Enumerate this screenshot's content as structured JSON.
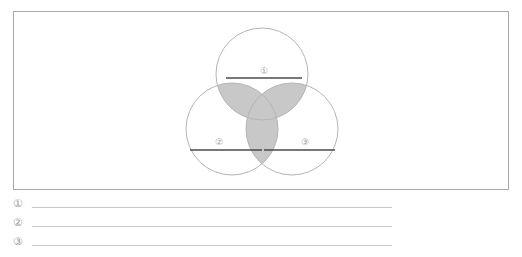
{
  "page": {
    "background_color": "#ffffff",
    "width": 522,
    "height": 257
  },
  "diagram_box": {
    "border_color": "#a8a8a8",
    "fill_color": "#ffffff"
  },
  "venn": {
    "type": "three-set-venn",
    "circle_stroke_color": "#b5b5b5",
    "circle_fill_color": "#ffffff",
    "overlap_fill_color": "#c8c8c8",
    "answer_line_color": "#4a4a4a",
    "label_color": "#9a9a9a",
    "circles": [
      {
        "id": "circle-1",
        "label": "①",
        "position": "top",
        "cx": 262,
        "cy": 74,
        "r": 46,
        "answer_line": {
          "x1": 226,
          "x2": 302,
          "y": 78
        },
        "label_x": 264,
        "label_y": 72
      },
      {
        "id": "circle-2",
        "label": "②",
        "position": "bottom-left",
        "cx": 232,
        "cy": 129,
        "r": 46,
        "answer_line": {
          "x1": 190,
          "x2": 262,
          "y": 150
        },
        "label_x": 219,
        "label_y": 143
      },
      {
        "id": "circle-3",
        "label": "③",
        "position": "bottom-right",
        "cx": 292,
        "cy": 129,
        "r": 46,
        "answer_line": {
          "x1": 264,
          "x2": 335,
          "y": 150
        },
        "label_x": 305,
        "label_y": 143
      }
    ]
  },
  "answers": {
    "line_color": "#c9c9c9",
    "marker_color": "#9a9a9a",
    "items": [
      {
        "marker": "①",
        "value": ""
      },
      {
        "marker": "②",
        "value": ""
      },
      {
        "marker": "③",
        "value": ""
      }
    ]
  }
}
